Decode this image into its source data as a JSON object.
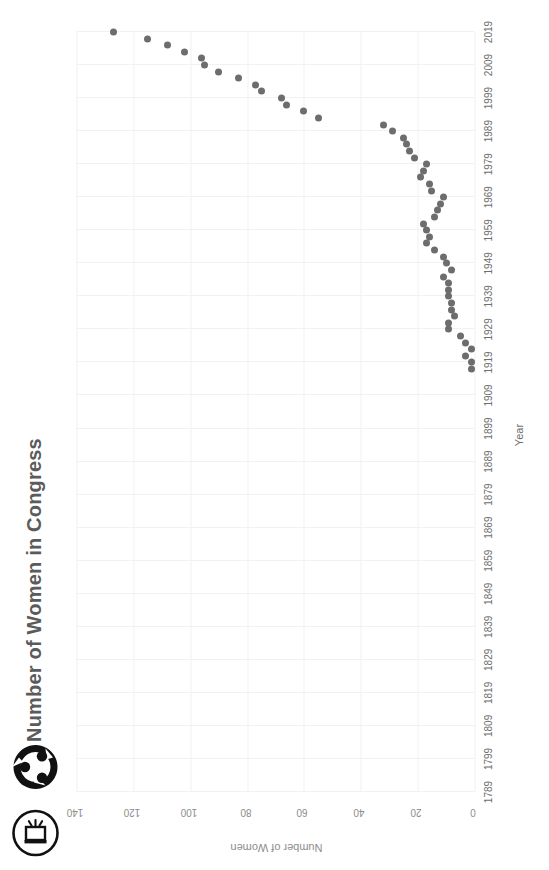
{
  "toolbar": {
    "items": [
      {
        "name": "export-icon",
        "label": "Export"
      },
      {
        "name": "share-icon",
        "label": "Share"
      }
    ]
  },
  "header": {
    "title": "Number of Women in Congress"
  },
  "colors": {
    "dot": "#6d6d6d",
    "grid": "#f2f2f4",
    "title": "#5b5b5b",
    "tick": "#8d8d8d",
    "axis_label": "#6e6e6e"
  },
  "chart_data": {
    "type": "scatter",
    "title": "Number of Women in Congress",
    "xlabel": "Year",
    "ylabel": "Number of Women",
    "xlim": [
      1789,
      2019
    ],
    "ylim": [
      0,
      140
    ],
    "grid": true,
    "legend": "none",
    "orientation": "rotated-90",
    "xticks": [
      1789,
      1799,
      1809,
      1819,
      1829,
      1839,
      1849,
      1859,
      1869,
      1879,
      1889,
      1899,
      1909,
      1919,
      1929,
      1939,
      1949,
      1959,
      1969,
      1979,
      1989,
      1999,
      2009,
      2019
    ],
    "yticks": [
      0,
      20,
      40,
      60,
      80,
      100,
      120,
      140
    ],
    "x": [
      1917,
      1919,
      1921,
      1923,
      1925,
      1927,
      1929,
      1931,
      1933,
      1935,
      1937,
      1939,
      1941,
      1943,
      1945,
      1947,
      1949,
      1951,
      1953,
      1955,
      1957,
      1959,
      1961,
      1963,
      1965,
      1967,
      1969,
      1971,
      1973,
      1975,
      1977,
      1979,
      1981,
      1983,
      1985,
      1987,
      1989,
      1991,
      1993,
      1995,
      1997,
      1999,
      2001,
      2003,
      2005,
      2007,
      2009,
      2011,
      2013,
      2015,
      2017,
      2019
    ],
    "y": [
      1,
      1,
      3,
      1,
      3,
      5,
      9,
      9,
      7,
      8,
      8,
      9,
      9,
      9,
      11,
      8,
      10,
      11,
      14,
      17,
      16,
      17,
      18,
      14,
      13,
      12,
      11,
      15,
      16,
      19,
      18,
      17,
      21,
      23,
      24,
      25,
      29,
      32,
      55,
      60,
      66,
      68,
      75,
      77,
      83,
      90,
      95,
      96,
      102,
      108,
      115,
      127
    ],
    "series": [
      {
        "name": "Number of Women in Congress",
        "points": [
          {
            "year": 1917,
            "value": 1
          },
          {
            "year": 1919,
            "value": 1
          },
          {
            "year": 1921,
            "value": 3
          },
          {
            "year": 1923,
            "value": 1
          },
          {
            "year": 1925,
            "value": 3
          },
          {
            "year": 1927,
            "value": 5
          },
          {
            "year": 1929,
            "value": 9
          },
          {
            "year": 1931,
            "value": 9
          },
          {
            "year": 1933,
            "value": 7
          },
          {
            "year": 1935,
            "value": 8
          },
          {
            "year": 1937,
            "value": 8
          },
          {
            "year": 1939,
            "value": 9
          },
          {
            "year": 1941,
            "value": 9
          },
          {
            "year": 1943,
            "value": 9
          },
          {
            "year": 1945,
            "value": 11
          },
          {
            "year": 1947,
            "value": 8
          },
          {
            "year": 1949,
            "value": 10
          },
          {
            "year": 1951,
            "value": 11
          },
          {
            "year": 1953,
            "value": 14
          },
          {
            "year": 1955,
            "value": 17
          },
          {
            "year": 1957,
            "value": 16
          },
          {
            "year": 1959,
            "value": 17
          },
          {
            "year": 1961,
            "value": 18
          },
          {
            "year": 1963,
            "value": 14
          },
          {
            "year": 1965,
            "value": 13
          },
          {
            "year": 1967,
            "value": 12
          },
          {
            "year": 1969,
            "value": 11
          },
          {
            "year": 1971,
            "value": 15
          },
          {
            "year": 1973,
            "value": 16
          },
          {
            "year": 1975,
            "value": 19
          },
          {
            "year": 1977,
            "value": 18
          },
          {
            "year": 1979,
            "value": 17
          },
          {
            "year": 1981,
            "value": 21
          },
          {
            "year": 1983,
            "value": 23
          },
          {
            "year": 1985,
            "value": 24
          },
          {
            "year": 1987,
            "value": 25
          },
          {
            "year": 1989,
            "value": 29
          },
          {
            "year": 1991,
            "value": 32
          },
          {
            "year": 1993,
            "value": 55
          },
          {
            "year": 1995,
            "value": 60
          },
          {
            "year": 1997,
            "value": 66
          },
          {
            "year": 1999,
            "value": 68
          },
          {
            "year": 2001,
            "value": 75
          },
          {
            "year": 2003,
            "value": 77
          },
          {
            "year": 2005,
            "value": 83
          },
          {
            "year": 2007,
            "value": 90
          },
          {
            "year": 2009,
            "value": 95
          },
          {
            "year": 2011,
            "value": 96
          },
          {
            "year": 2013,
            "value": 102
          },
          {
            "year": 2015,
            "value": 108
          },
          {
            "year": 2017,
            "value": 115
          },
          {
            "year": 2019,
            "value": 127
          }
        ]
      }
    ]
  }
}
